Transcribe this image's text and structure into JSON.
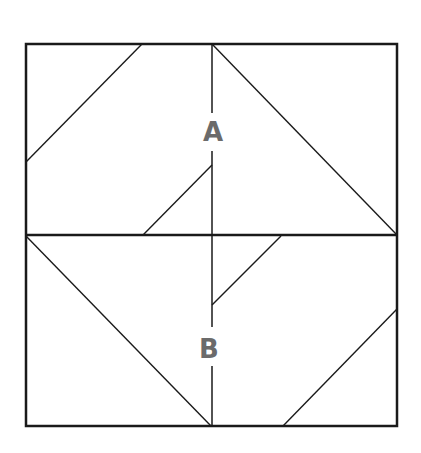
{
  "diagram": {
    "type": "geometric-figure",
    "colors": {
      "stroke": "#1a1a1a",
      "label": "#6b6b6b",
      "background": "#ffffff"
    },
    "labels": {
      "a": "A",
      "b": "B"
    },
    "outer_square": {
      "x1": 26,
      "y1": 44,
      "x2": 397,
      "y2": 426
    },
    "middle_line_y": 235,
    "center_line_x": 212,
    "segments": [
      {
        "name": "upper-left-diagonal",
        "x1": 142,
        "y1": 44,
        "x2": 26,
        "y2": 162
      },
      {
        "name": "upper-right-diagonal",
        "x1": 212,
        "y1": 44,
        "x2": 397,
        "y2": 235
      },
      {
        "name": "upper-inner-diagonal",
        "x1": 143,
        "y1": 235,
        "x2": 212,
        "y2": 165
      },
      {
        "name": "lower-inner-diagonal",
        "x1": 281,
        "y1": 236,
        "x2": 212,
        "y2": 305
      },
      {
        "name": "lower-left-diagonal",
        "x1": 26,
        "y1": 236,
        "x2": 211,
        "y2": 426
      },
      {
        "name": "lower-right-diagonal",
        "x1": 397,
        "y1": 309,
        "x2": 283,
        "y2": 426
      }
    ],
    "center_line_segments": [
      {
        "y1": 44,
        "y2": 113
      },
      {
        "y1": 151,
        "y2": 327
      },
      {
        "y1": 366,
        "y2": 426
      }
    ]
  }
}
